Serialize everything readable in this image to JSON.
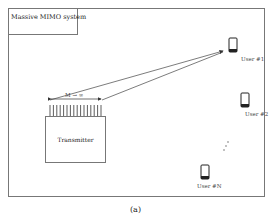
{
  "diagram": {
    "title": "Massive MIMO system",
    "transmitter_label": "Transmitter",
    "antenna_array_label": "M → ∞",
    "antenna_count_drawn": 16,
    "users": [
      {
        "label": "User #1",
        "icon": "smartphone-icon"
      },
      {
        "label": "User #2",
        "icon": "smartphone-icon"
      },
      {
        "label": "User #N",
        "icon": "smartphone-icon"
      }
    ],
    "ellipsis": "⋮",
    "caption": "(a)"
  }
}
